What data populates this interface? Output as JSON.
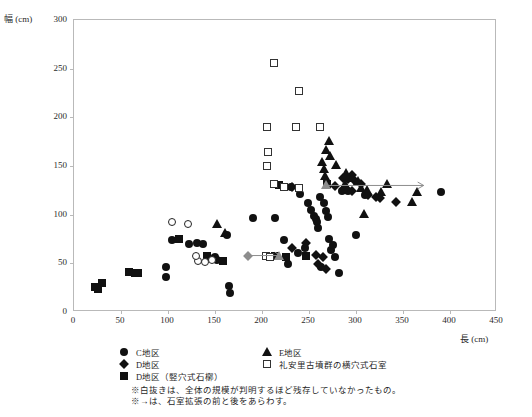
{
  "chart_data": {
    "type": "scatter",
    "title": "",
    "xlabel": "長 (cm)",
    "ylabel": "幅 (cm)",
    "xlim": [
      0,
      450
    ],
    "ylim": [
      0,
      300
    ],
    "xticks": [
      0,
      50,
      100,
      150,
      200,
      250,
      300,
      350,
      400,
      450
    ],
    "yticks": [
      0,
      50,
      100,
      150,
      200,
      250,
      300
    ],
    "grid": false,
    "legend_position": "below-plot",
    "series": [
      {
        "name": "C地区",
        "marker": "circle",
        "points": [
          [
            98,
            36
          ],
          [
            98,
            46
          ],
          [
            104,
            74
          ],
          [
            122,
            70
          ],
          [
            131,
            71
          ],
          [
            137,
            70
          ],
          [
            163,
            79
          ],
          [
            143,
            57
          ],
          [
            150,
            57
          ],
          [
            152,
            53
          ],
          [
            165,
            27
          ],
          [
            166,
            20
          ],
          [
            190,
            97
          ],
          [
            214,
            97
          ],
          [
            223,
            74
          ],
          [
            231,
            128
          ],
          [
            240,
            121
          ],
          [
            249,
            112
          ],
          [
            252,
            105
          ],
          [
            255,
            99
          ],
          [
            257,
            96
          ],
          [
            259,
            92
          ],
          [
            260,
            86
          ],
          [
            262,
            118
          ],
          [
            266,
            112
          ],
          [
            268,
            104
          ],
          [
            270,
            98
          ],
          [
            271,
            75
          ],
          [
            273,
            64
          ],
          [
            276,
            69
          ],
          [
            278,
            57
          ],
          [
            285,
            124
          ],
          [
            292,
            124
          ],
          [
            300,
            79
          ],
          [
            310,
            120
          ],
          [
            390,
            123
          ],
          [
            238,
            61
          ],
          [
            246,
            66
          ],
          [
            228,
            49
          ],
          [
            263,
            46
          ],
          [
            282,
            40
          ]
        ]
      },
      {
        "name": "D地区",
        "marker": "diamond",
        "points": [
          [
            232,
            66
          ],
          [
            257,
            59
          ],
          [
            265,
            57
          ],
          [
            260,
            49
          ],
          [
            268,
            44
          ],
          [
            286,
            138
          ],
          [
            292,
            137
          ],
          [
            296,
            141
          ],
          [
            299,
            135
          ],
          [
            305,
            132
          ],
          [
            313,
            120
          ],
          [
            321,
            118
          ],
          [
            326,
            117
          ],
          [
            232,
            128
          ],
          [
            247,
            71
          ],
          [
            278,
            129
          ],
          [
            296,
            124
          ],
          [
            343,
            113
          ]
        ]
      },
      {
        "name": "D地区（竪穴式石槨）",
        "marker": "square",
        "points": [
          [
            22,
            26
          ],
          [
            25,
            24
          ],
          [
            30,
            30
          ],
          [
            59,
            41
          ],
          [
            65,
            40
          ],
          [
            68,
            40
          ],
          [
            112,
            75
          ],
          [
            141,
            58
          ],
          [
            159,
            52
          ],
          [
            214,
            58
          ],
          [
            218,
            130
          ],
          [
            226,
            57
          ],
          [
            247,
            58
          ],
          [
            269,
            131
          ]
        ]
      },
      {
        "name": "E地区",
        "marker": "triangle",
        "points": [
          [
            152,
            90
          ],
          [
            161,
            81
          ],
          [
            264,
            154
          ],
          [
            266,
            147
          ],
          [
            267,
            140
          ],
          [
            268,
            166
          ],
          [
            271,
            176
          ],
          [
            272,
            160
          ],
          [
            279,
            151
          ],
          [
            289,
            143
          ],
          [
            296,
            138
          ],
          [
            302,
            135
          ],
          [
            305,
            127
          ],
          [
            312,
            125
          ],
          [
            327,
            123
          ],
          [
            333,
            131
          ],
          [
            360,
            113
          ],
          [
            365,
            123
          ],
          [
            309,
            101
          ],
          [
            288,
            131
          ]
        ]
      },
      {
        "name": "礼安里古墳群の横穴式石室",
        "marker": "square-open",
        "points": [
          [
            213,
            256
          ],
          [
            239,
            227
          ],
          [
            205,
            190
          ],
          [
            206,
            164
          ],
          [
            205,
            150
          ],
          [
            236,
            190
          ],
          [
            262,
            190
          ],
          [
            213,
            131
          ],
          [
            223,
            128
          ],
          [
            239,
            127
          ],
          [
            204,
            58
          ],
          [
            208,
            57
          ]
        ]
      },
      {
        "name": "white-open-circles",
        "marker": "circle-open",
        "points": [
          [
            104,
            92
          ],
          [
            121,
            90
          ],
          [
            132,
            52
          ],
          [
            139,
            51
          ],
          [
            147,
            53
          ],
          [
            130,
            58
          ]
        ]
      },
      {
        "name": "expansion-before-after-gray",
        "marker": "gray",
        "points": [
          [
            185,
            58
          ],
          [
            218,
            58
          ],
          [
            268,
            130
          ]
        ]
      }
    ],
    "arrows": [
      {
        "x1": 185,
        "y1": 58,
        "x2": 220,
        "y2": 58
      },
      {
        "x1": 268,
        "y1": 130,
        "x2": 372,
        "y2": 130
      }
    ]
  },
  "axes": {
    "y_title": "幅 (cm)",
    "x_title": "長 (cm)",
    "y_tick_labels": [
      "300",
      "250",
      "200",
      "150",
      "100",
      "50",
      "0"
    ],
    "x_tick_labels": [
      "0",
      "50",
      "100",
      "150",
      "200",
      "250",
      "300",
      "350",
      "400",
      "450"
    ]
  },
  "legend": {
    "column1": [
      {
        "label": "C地区",
        "marker": "circle"
      },
      {
        "label": "D地区",
        "marker": "diamond"
      },
      {
        "label": "D地区（竪穴式石槨）",
        "marker": "square"
      }
    ],
    "column2": [
      {
        "label": "E地区",
        "marker": "triangle"
      },
      {
        "label": "礼安里古墳群の横穴式石室",
        "marker": "square-open"
      }
    ]
  },
  "notes": [
    "※白抜きは、全体の規模が判明するほど残存していなかったもの。",
    "※→は、石室拡張の前と後をあらわす。"
  ],
  "colors": {
    "marker_fill": "#111111",
    "marker_gray": "#8d8d8d",
    "frame": "#b9b9b9",
    "text": "#1f1f1f"
  }
}
